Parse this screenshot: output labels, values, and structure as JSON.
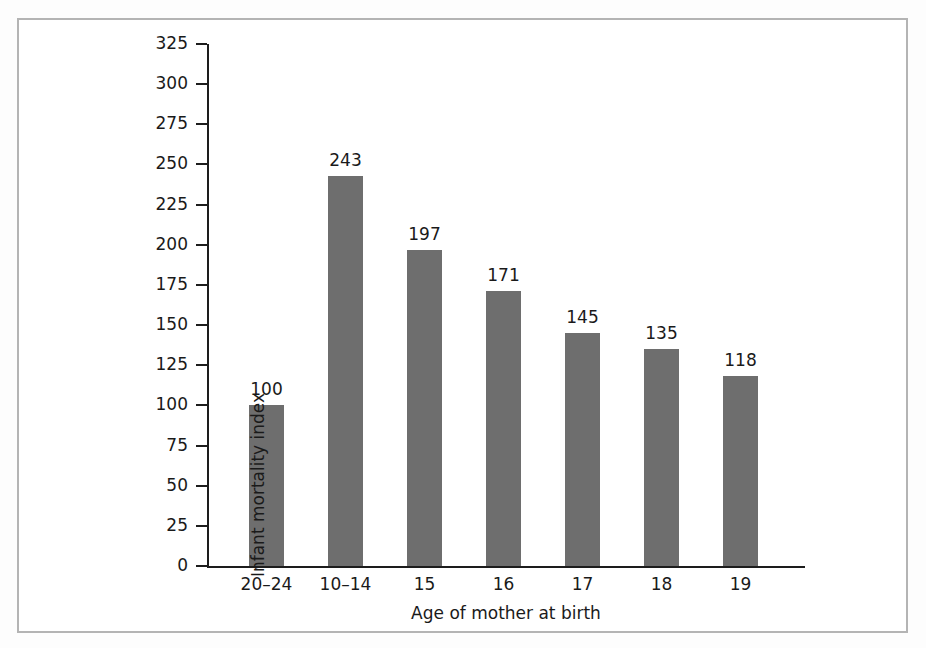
{
  "figure": {
    "frame_border_color": "#b4b4b4",
    "background_color": "#ffffff"
  },
  "chart_data": {
    "type": "bar",
    "title": "",
    "subtitle": "",
    "xlabel": "Age of mother at birth",
    "ylabel": "Infant mortality index",
    "categories": [
      "20–24",
      "10–14",
      "15",
      "16",
      "17",
      "18",
      "19"
    ],
    "values": [
      100,
      243,
      197,
      171,
      145,
      135,
      118
    ],
    "data_labels": [
      "100",
      "243",
      "197",
      "171",
      "145",
      "135",
      "118"
    ],
    "ylim": [
      0,
      325
    ],
    "ytick_interval": 25,
    "ytick_labels": [
      "0",
      "25",
      "50",
      "75",
      "100",
      "125",
      "150",
      "175",
      "200",
      "225",
      "250",
      "275",
      "300",
      "325"
    ],
    "ytick_values": [
      0,
      25,
      50,
      75,
      100,
      125,
      150,
      175,
      200,
      225,
      250,
      275,
      300,
      325
    ],
    "grid": false,
    "legend": null,
    "bar_color": "#6e6e6e",
    "axis_color": "#1d1d1d",
    "text_color": "#1a1a1a"
  }
}
